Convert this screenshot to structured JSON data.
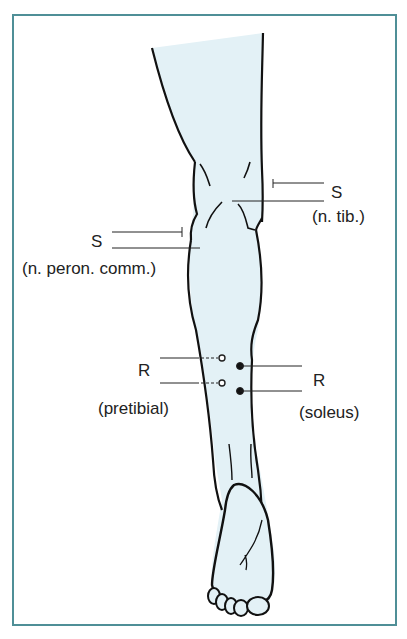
{
  "diagram": {
    "title": "",
    "colors": {
      "frame": "#4f8f97",
      "leg_fill": "#e3f1f6",
      "stroke": "#111111"
    },
    "labels": {
      "s_tib": "S",
      "s_tib_sub": "(n. tib.)",
      "s_peron": "S",
      "s_peron_sub": "(n. peron. comm.)",
      "r_pretibial": "R",
      "r_pretibial_sub": "(pretibial)",
      "r_soleus": "R",
      "r_soleus_sub": "(soleus)"
    },
    "markers": [
      {
        "type": "stimulation",
        "label": "S",
        "nerve": "n. tib."
      },
      {
        "type": "stimulation",
        "label": "S",
        "nerve": "n. peron. comm."
      },
      {
        "type": "recording",
        "label": "R",
        "muscle": "pretibial",
        "electrodes": "open-circles"
      },
      {
        "type": "recording",
        "label": "R",
        "muscle": "soleus",
        "electrodes": "filled-circles"
      }
    ]
  }
}
